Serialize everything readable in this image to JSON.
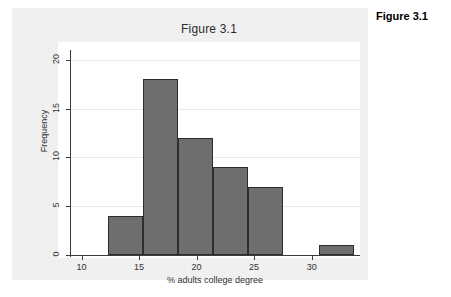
{
  "caption": "Figure 3.1",
  "chart_data": {
    "type": "bar",
    "title": "Figure 3.1",
    "xlabel": "% adults college degree",
    "ylabel": "Frequency",
    "xlim": [
      9.0,
      34.2
    ],
    "ylim": [
      0,
      21
    ],
    "grid": true,
    "legend": false,
    "bin_width": 3.05,
    "bins": [
      {
        "start": 12.3,
        "end": 15.35,
        "center": 13.8,
        "value": 4
      },
      {
        "start": 15.35,
        "end": 18.4,
        "center": 16.9,
        "value": 18
      },
      {
        "start": 18.4,
        "end": 21.45,
        "center": 19.9,
        "value": 12
      },
      {
        "start": 21.45,
        "end": 24.5,
        "center": 23.0,
        "value": 9
      },
      {
        "start": 24.5,
        "end": 27.55,
        "center": 26.0,
        "value": 7
      },
      {
        "start": 30.6,
        "end": 33.65,
        "center": 32.1,
        "value": 1
      }
    ],
    "values": [
      4,
      18,
      12,
      9,
      7,
      1
    ],
    "categories": [
      "12.3-15.4",
      "15.4-18.4",
      "18.4-21.5",
      "21.5-24.5",
      "24.5-27.6",
      "30.6-33.7"
    ],
    "xticks": [
      10,
      15,
      20,
      25,
      30
    ],
    "xtick_labels": [
      "10",
      "15",
      "20",
      "25",
      "30"
    ],
    "yticks": [
      0,
      5,
      10,
      15,
      20
    ],
    "ytick_labels": [
      "0",
      "5",
      "10",
      "15",
      "20"
    ],
    "colors": {
      "bar_fill": "#6e6e6e",
      "bar_outline": "#2d2d2d",
      "plot_background": "#ffffff",
      "figure_background": "#f0f0f0",
      "gridline": "#e8e8e8",
      "axis": "#3a3a3a",
      "text": "#303030"
    }
  }
}
